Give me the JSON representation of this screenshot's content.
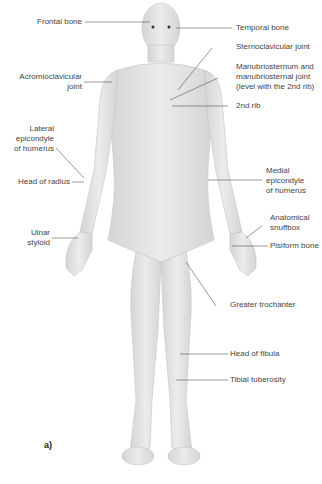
{
  "figure": {
    "panel_label": "a)"
  },
  "labels_left": [
    {
      "id": "frontal-bone",
      "lines": [
        "Frontal bone"
      ]
    },
    {
      "id": "acromioclavicular-joint",
      "lines": [
        "Acromioclavicular",
        "joint"
      ]
    },
    {
      "id": "lateral-epicondyle",
      "lines": [
        "Lateral",
        "epicondyle",
        "of humerus"
      ]
    },
    {
      "id": "head-of-radius",
      "lines": [
        "Head of radius"
      ]
    },
    {
      "id": "ulnar-styloid",
      "lines": [
        "Ulnar",
        "styloid"
      ]
    }
  ],
  "labels_right": [
    {
      "id": "temporal-bone",
      "lines": [
        "Temporal bone"
      ]
    },
    {
      "id": "sternoclavicular-joint",
      "lines": [
        "Sternoclavicular joint"
      ]
    },
    {
      "id": "manubriosternum",
      "lines": [
        "Manubriosternum and",
        "manubriosternal joint",
        "(level with the 2nd rib)"
      ]
    },
    {
      "id": "2nd-rib",
      "lines": [
        "2nd rib"
      ]
    },
    {
      "id": "medial-epicondyle",
      "lines": [
        "Medial",
        "epicondyle",
        "of humerus"
      ]
    },
    {
      "id": "anatomical-snuffbox",
      "lines": [
        "Anatomical",
        "snuffbox"
      ]
    },
    {
      "id": "pisiform-bone",
      "lines": [
        "Pisiform bone"
      ]
    },
    {
      "id": "greater-trochanter",
      "lines": [
        "Greater trochanter"
      ]
    },
    {
      "id": "head-of-fibula",
      "lines": [
        "Head of fibula"
      ]
    },
    {
      "id": "tibial-tuberosity",
      "lines": [
        "Tibial tuberosity"
      ]
    }
  ],
  "colors": {
    "skin": "#e6e6e6",
    "skin_shadow": "#cfcfcf",
    "leader": "#555555",
    "text": "#444444"
  }
}
